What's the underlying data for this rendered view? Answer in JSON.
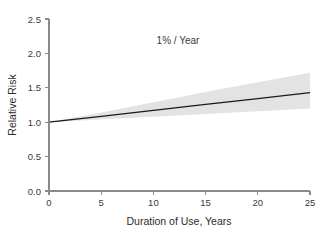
{
  "chart_data": {
    "type": "line",
    "title": "",
    "annotation": "1% / Year",
    "xlabel": "Duration of Use, Years",
    "ylabel": "Relative Risk",
    "xlim": [
      0,
      25
    ],
    "ylim": [
      0.0,
      2.5
    ],
    "xticks": [
      0,
      5,
      10,
      15,
      20,
      25
    ],
    "xtick_labels": [
      "0",
      "5",
      "10",
      "15",
      "20",
      "25"
    ],
    "yticks": [
      0.0,
      0.5,
      1.0,
      1.5,
      2.0,
      2.5
    ],
    "ytick_labels": [
      "0.0",
      "0.5",
      "1.0",
      "1.5",
      "2.0",
      "2.5"
    ],
    "grid": false,
    "legend": "none",
    "series": [
      {
        "name": "Relative Risk",
        "role": "fit-line",
        "color": "#1a1a1a",
        "x": [
          0,
          5,
          10,
          15,
          20,
          25
        ],
        "values": [
          1.0,
          1.086,
          1.172,
          1.258,
          1.344,
          1.43
        ]
      },
      {
        "name": "95% Confidence Interval",
        "role": "confidence-band",
        "color": "#e3e3e3",
        "x": [
          0,
          5,
          10,
          15,
          20,
          25
        ],
        "upper": [
          1.0,
          1.14,
          1.29,
          1.44,
          1.58,
          1.72
        ],
        "lower": [
          1.0,
          1.04,
          1.08,
          1.12,
          1.16,
          1.2
        ]
      }
    ]
  },
  "axes": {
    "y_title": "Relative Risk",
    "x_title": "Duration of Use, Years"
  },
  "annotations": {
    "rate": "1% / Year"
  },
  "colors": {
    "background": "#ffffff",
    "axis": "#8a8a8a",
    "line": "#1a1a1a",
    "band": "#e3e3e3",
    "text": "#3a3a3a"
  }
}
